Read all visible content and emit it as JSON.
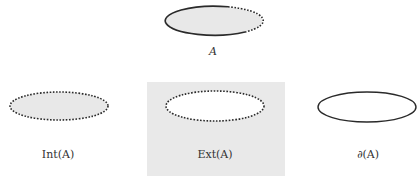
{
  "diagram": {
    "colors": {
      "fill_gray": "#e8e8e8",
      "box_gray": "#e9e9e9",
      "stroke": "#2a2a2a",
      "background": "#ffffff"
    },
    "panels": [
      {
        "id": "set-a",
        "label": "A",
        "boundary": "partial (solid left/bottom, dotted upper-right)",
        "fill": "gray"
      },
      {
        "id": "interior",
        "label": "Int(A)",
        "boundary": "dotted",
        "fill": "gray"
      },
      {
        "id": "exterior",
        "label": "Ext(A)",
        "boundary": "dotted",
        "fill": "white inside gray box"
      },
      {
        "id": "boundary",
        "label": "∂(A)",
        "boundary": "solid",
        "fill": "none"
      }
    ]
  }
}
